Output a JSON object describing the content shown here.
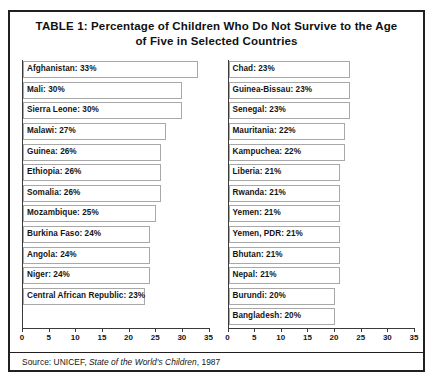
{
  "table": {
    "title_line1": "TABLE 1: Percentage of Children Who Do Not Survive to the Age",
    "title_line2": "of Five in Selected Countries",
    "source_prefix": "Source: UNICEF, ",
    "source_work": "State of the World's Children",
    "source_suffix": ", 1987"
  },
  "chart_data": {
    "type": "bar",
    "title": "TABLE 1: Percentage of Children Who Do Not Survive to the Age of Five in Selected Countries",
    "orientation": "horizontal",
    "xlabel": "",
    "ylabel": "",
    "xlim": [
      0,
      35
    ],
    "xticks": [
      0,
      5,
      10,
      15,
      20,
      25,
      30,
      35
    ],
    "grid": false,
    "legend": "none",
    "units": "percent",
    "panels": [
      {
        "name": "left-panel",
        "categories": [
          "Afghanistan",
          "Mali",
          "Sierra Leone",
          "Malawi",
          "Guinea",
          "Ethiopia",
          "Somalia",
          "Mozambique",
          "Burkina Faso",
          "Angola",
          "Niger",
          "Central African Republic"
        ],
        "values": [
          33,
          30,
          30,
          27,
          26,
          26,
          26,
          25,
          24,
          24,
          24,
          23
        ],
        "bars": [
          {
            "label": "Afghanistan: 33%",
            "country": "Afghanistan",
            "value": 33
          },
          {
            "label": "Mali: 30%",
            "country": "Mali",
            "value": 30
          },
          {
            "label": "Sierra Leone: 30%",
            "country": "Sierra Leone",
            "value": 30
          },
          {
            "label": "Malawi: 27%",
            "country": "Malawi",
            "value": 27
          },
          {
            "label": "Guinea: 26%",
            "country": "Guinea",
            "value": 26
          },
          {
            "label": "Ethiopia: 26%",
            "country": "Ethiopia",
            "value": 26
          },
          {
            "label": "Somalia: 26%",
            "country": "Somalia",
            "value": 26
          },
          {
            "label": "Mozambique: 25%",
            "country": "Mozambique",
            "value": 25
          },
          {
            "label": "Burkina Faso: 24%",
            "country": "Burkina Faso",
            "value": 24
          },
          {
            "label": "Angola: 24%",
            "country": "Angola",
            "value": 24
          },
          {
            "label": "Niger: 24%",
            "country": "Niger",
            "value": 24
          },
          {
            "label": "Central African Republic: 23%",
            "country": "Central African Republic",
            "value": 23
          }
        ]
      },
      {
        "name": "right-panel",
        "categories": [
          "Chad",
          "Guinea-Bissau",
          "Senegal",
          "Mauritania",
          "Kampuchea",
          "Liberia",
          "Rwanda",
          "Yemen",
          "Yemen, PDR",
          "Bhutan",
          "Nepal",
          "Burundi",
          "Bangladesh"
        ],
        "values": [
          23,
          23,
          23,
          22,
          22,
          21,
          21,
          21,
          21,
          21,
          21,
          20,
          20
        ],
        "bars": [
          {
            "label": "Chad: 23%",
            "country": "Chad",
            "value": 23
          },
          {
            "label": "Guinea-Bissau: 23%",
            "country": "Guinea-Bissau",
            "value": 23
          },
          {
            "label": "Senegal: 23%",
            "country": "Senegal",
            "value": 23
          },
          {
            "label": "Mauritania: 22%",
            "country": "Mauritania",
            "value": 22
          },
          {
            "label": "Kampuchea: 22%",
            "country": "Kampuchea",
            "value": 22
          },
          {
            "label": "Liberia: 21%",
            "country": "Liberia",
            "value": 21
          },
          {
            "label": "Rwanda: 21%",
            "country": "Rwanda",
            "value": 21
          },
          {
            "label": "Yemen: 21%",
            "country": "Yemen",
            "value": 21
          },
          {
            "label": "Yemen, PDR: 21%",
            "country": "Yemen, PDR",
            "value": 21
          },
          {
            "label": "Bhutan: 21%",
            "country": "Bhutan",
            "value": 21
          },
          {
            "label": "Nepal: 21%",
            "country": "Nepal",
            "value": 21
          },
          {
            "label": "Burundi: 20%",
            "country": "Burundi",
            "value": 20
          },
          {
            "label": "Bangladesh: 20%",
            "country": "Bangladesh",
            "value": 20
          }
        ]
      }
    ]
  }
}
